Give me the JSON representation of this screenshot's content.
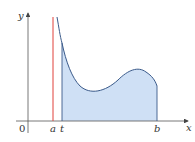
{
  "figure": {
    "type": "area-under-curve diagram",
    "axes": {
      "x_label": "x",
      "y_label": "y",
      "origin_label": "0"
    },
    "markers": {
      "a": {
        "label": "a",
        "description": "vertical asymptote"
      },
      "t": {
        "label": "t",
        "description": "left bound of shaded area"
      },
      "b": {
        "label": "b",
        "description": "right bound of shaded area"
      }
    },
    "colors": {
      "asymptote": "#e0403a",
      "curve": "#3a5a8a",
      "fill": "#cfe0f5",
      "axis": "#555555"
    }
  }
}
